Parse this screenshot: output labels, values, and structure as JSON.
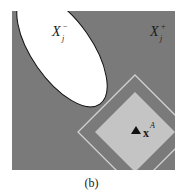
{
  "figure": {
    "caption": "(b)",
    "colors": {
      "background": "#ffffff",
      "region_fill": "#7a7a7a",
      "ellipse_fill": "#ffffff",
      "ellipse_stroke": "#111111",
      "diamond_inner_fill": "#c4c4c4",
      "diamond_outline": "#d2d2d2",
      "marker": "#111111"
    },
    "labels": {
      "x_minus": {
        "base": "X",
        "sub": "j",
        "sup": "−"
      },
      "x_plus": {
        "base": "X",
        "sub": "j",
        "sup": "+"
      },
      "point": {
        "base": "x",
        "sup": "A"
      }
    },
    "marker": "triangle-up"
  }
}
